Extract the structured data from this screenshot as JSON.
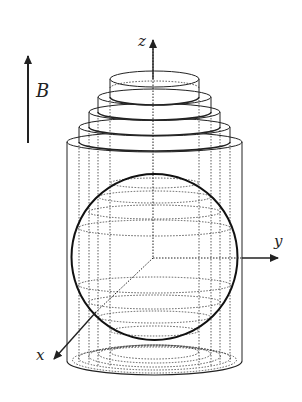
{
  "figure": {
    "colors": {
      "stroke": "#222222",
      "background": "#ffffff"
    },
    "labels": {
      "field": "B",
      "z_axis": "z",
      "y_axis": "y",
      "x_axis": "x"
    },
    "elements": {
      "field_arrow": {
        "direction": "up"
      },
      "disks": [
        {
          "level": 1,
          "note": "smallest top disk"
        },
        {
          "level": 2
        },
        {
          "level": 3
        },
        {
          "level": 4
        },
        {
          "level": 5,
          "note": "outer cylinder"
        }
      ],
      "sphere": {
        "style": "solid outline with dotted latitude rings"
      }
    }
  }
}
